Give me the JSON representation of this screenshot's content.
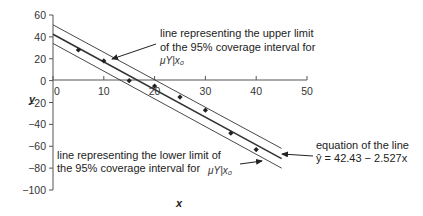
{
  "chart_data": {
    "type": "scatter",
    "title": "",
    "xlabel": "x",
    "ylabel": "y",
    "xlim": [
      0,
      50
    ],
    "ylim": [
      -100,
      60
    ],
    "x_ticks": [
      0,
      10,
      20,
      30,
      40,
      50
    ],
    "y_ticks": [
      60,
      40,
      20,
      0,
      -20,
      -40,
      -60,
      -80,
      -100
    ],
    "grid": false,
    "legend": "none",
    "series": [
      {
        "name": "observations",
        "type": "scatter",
        "x": [
          5,
          10,
          15,
          20,
          25,
          30,
          35,
          40
        ],
        "y": [
          28,
          18,
          0,
          -5,
          -15,
          -27,
          -48,
          -63
        ]
      },
      {
        "name": "fitted line",
        "type": "line",
        "x": [
          0,
          45
        ],
        "y": [
          42.43,
          -71.29
        ]
      },
      {
        "name": "upper limit of 95% coverage interval",
        "type": "line",
        "x": [
          0,
          45
        ],
        "y": [
          51,
          -62
        ]
      },
      {
        "name": "lower limit of 95% coverage interval",
        "type": "line",
        "x": [
          0,
          45
        ],
        "y": [
          34,
          -80
        ]
      }
    ],
    "annotations": [
      {
        "text": "line representing the upper limit of the 95% coverage interval for μY|x0",
        "target": "upper limit line"
      },
      {
        "text": "line representing the lower limit of the 95% coverage interval for μY|x0",
        "target": "lower limit line"
      },
      {
        "text": "equation of the line ŷ=42.43−2.527x",
        "target": "fitted line"
      }
    ]
  },
  "labels": {
    "x_axis": "x",
    "y_axis": "y",
    "x_ticks": [
      "0",
      "10",
      "20",
      "30",
      "40",
      "50"
    ],
    "y_ticks": [
      "60",
      "40",
      "20",
      "0",
      "−20",
      "−40",
      "−60",
      "−80",
      "−100"
    ],
    "upper_annot_line1": "line representing the upper limit",
    "upper_annot_line2": "of the 95% coverage interval for",
    "upper_annot_sub": "μY|x₀",
    "lower_annot_line1": "line representing the lower limit of",
    "lower_annot_line2": "the 95% coverage interval for",
    "lower_annot_sub": "μY|x₀",
    "eq_line1": "equation of the line",
    "eq_line2": "ŷ = 42.43 − 2.527x"
  },
  "colors": {
    "axis": "#555555",
    "line": "#333333",
    "point": "#222222"
  }
}
